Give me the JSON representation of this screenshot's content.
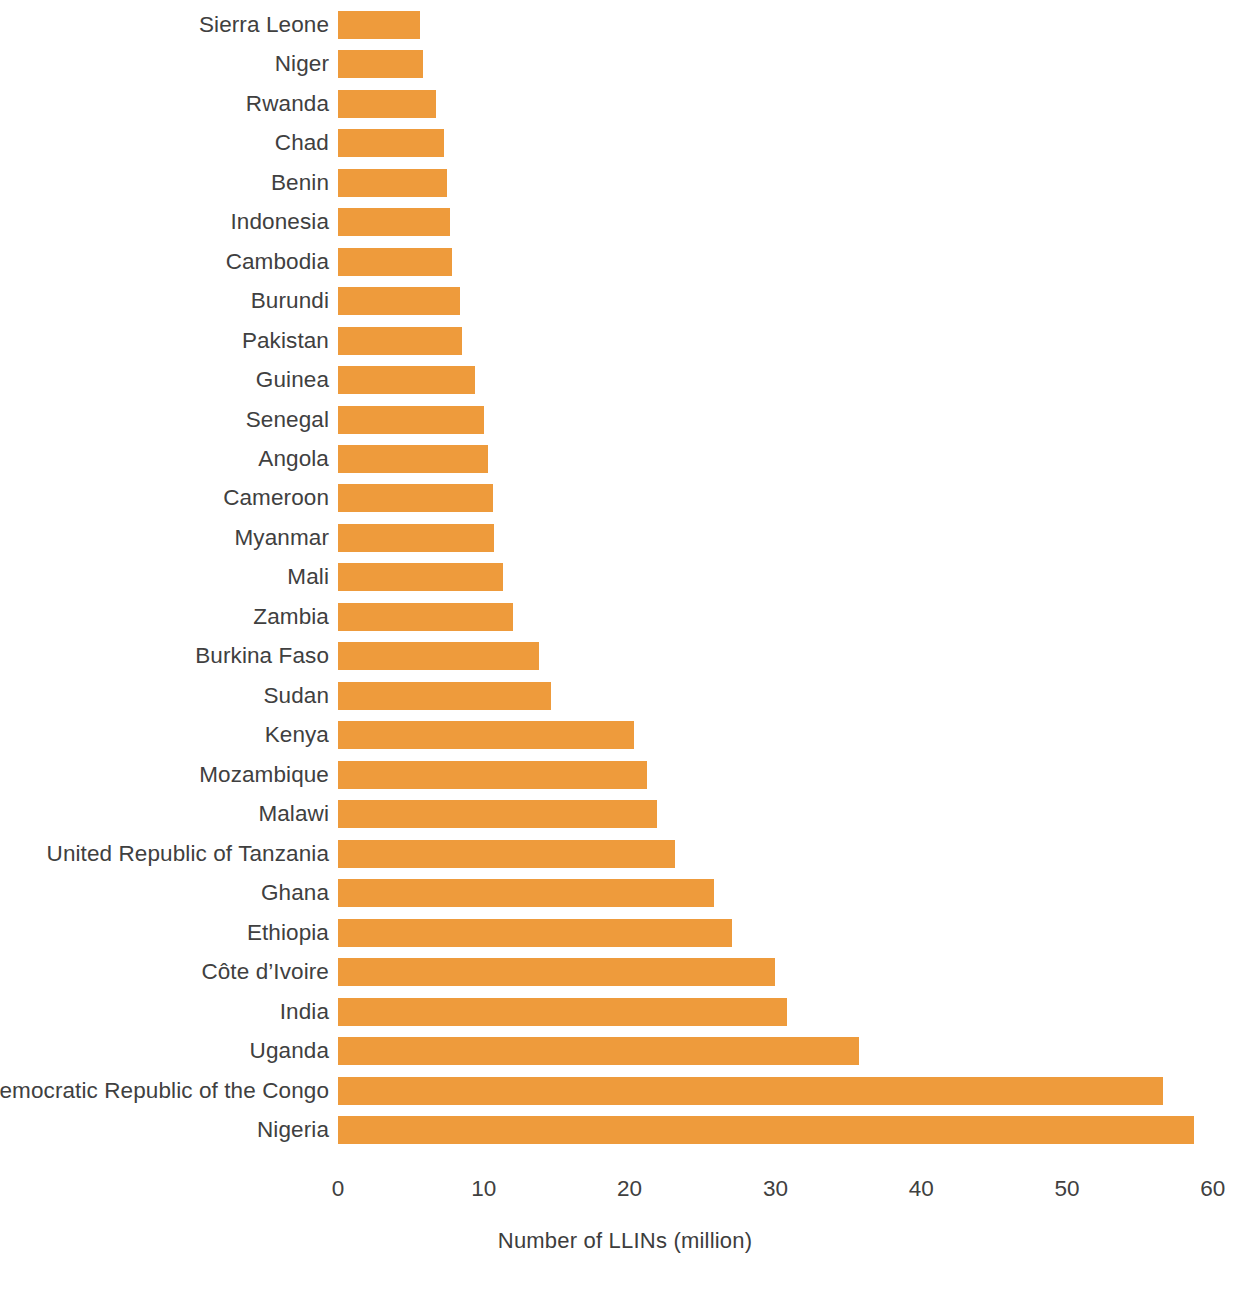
{
  "chart_data": {
    "type": "bar",
    "orientation": "horizontal",
    "title": "",
    "subtitle": "",
    "xlabel": "Number of LLINs (million)",
    "ylabel": "",
    "xlim": [
      0,
      60
    ],
    "xticks": [
      0,
      10,
      20,
      30,
      40,
      50,
      60
    ],
    "xtick_labels": [
      "0",
      "10",
      "20",
      "30",
      "40",
      "50",
      "60"
    ],
    "grid": false,
    "legend": null,
    "legend_position": "none",
    "bar_color": "#ee9b3c",
    "background_color": "#ffffff",
    "text_color": "#404040",
    "sort_order": "ascending-top-to-bottom",
    "categories": [
      "Sierra Leone",
      "Niger",
      "Rwanda",
      "Chad",
      "Benin",
      "Indonesia",
      "Cambodia",
      "Burundi",
      "Pakistan",
      "Guinea",
      "Senegal",
      "Angola",
      "Cameroon",
      "Myanmar",
      "Mali",
      "Zambia",
      "Burkina Faso",
      "Sudan",
      "Kenya",
      "Mozambique",
      "Malawi",
      "United Republic of Tanzania",
      "Ghana",
      "Ethiopia",
      "Côte d’Ivoire",
      "India",
      "Uganda",
      "Democratic Republic of the Congo",
      "Nigeria"
    ],
    "values": [
      5.6,
      5.8,
      6.7,
      7.3,
      7.5,
      7.7,
      7.8,
      8.4,
      8.5,
      9.4,
      10.0,
      10.3,
      10.6,
      10.7,
      11.3,
      12.0,
      13.8,
      14.6,
      20.3,
      21.2,
      21.9,
      23.1,
      25.8,
      27.0,
      30.0,
      30.8,
      35.7,
      56.6,
      58.7
    ],
    "bars": [
      {
        "category": "Sierra Leone",
        "value": 5.6
      },
      {
        "category": "Niger",
        "value": 5.8
      },
      {
        "category": "Rwanda",
        "value": 6.7
      },
      {
        "category": "Chad",
        "value": 7.3
      },
      {
        "category": "Benin",
        "value": 7.5
      },
      {
        "category": "Indonesia",
        "value": 7.7
      },
      {
        "category": "Cambodia",
        "value": 7.8
      },
      {
        "category": "Burundi",
        "value": 8.4
      },
      {
        "category": "Pakistan",
        "value": 8.5
      },
      {
        "category": "Guinea",
        "value": 9.4
      },
      {
        "category": "Senegal",
        "value": 10.0
      },
      {
        "category": "Angola",
        "value": 10.3
      },
      {
        "category": "Cameroon",
        "value": 10.6
      },
      {
        "category": "Myanmar",
        "value": 10.7
      },
      {
        "category": "Mali",
        "value": 11.3
      },
      {
        "category": "Zambia",
        "value": 12.0
      },
      {
        "category": "Burkina Faso",
        "value": 13.8
      },
      {
        "category": "Sudan",
        "value": 14.6
      },
      {
        "category": "Kenya",
        "value": 20.3
      },
      {
        "category": "Mozambique",
        "value": 21.2
      },
      {
        "category": "Malawi",
        "value": 21.9
      },
      {
        "category": "United Republic of Tanzania",
        "value": 23.1
      },
      {
        "category": "Ghana",
        "value": 25.8
      },
      {
        "category": "Ethiopia",
        "value": 27.0
      },
      {
        "category": "Côte d’Ivoire",
        "value": 30.0
      },
      {
        "category": "India",
        "value": 30.8
      },
      {
        "category": "Uganda",
        "value": 35.7
      },
      {
        "category": "Democratic Republic of the Congo",
        "value": 56.6
      },
      {
        "category": "Nigeria",
        "value": 58.7
      }
    ]
  }
}
